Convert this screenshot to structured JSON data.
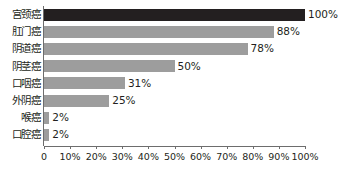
{
  "chart_data": {
    "type": "bar",
    "orientation": "horizontal",
    "title": "",
    "xlabel": "",
    "ylabel": "",
    "xlim": [
      0,
      100
    ],
    "grid": false,
    "legend": null,
    "categories": [
      "宫颈癌",
      "肛门癌",
      "阴道癌",
      "阴茎癌",
      "口咽癌",
      "外阴癌",
      "喉癌",
      "口腔癌"
    ],
    "values": [
      100,
      88,
      78,
      50,
      31,
      25,
      2,
      2
    ],
    "value_labels": [
      "100%",
      "88%",
      "78%",
      "50%",
      "31%",
      "25%",
      "2%",
      "2%"
    ],
    "bar_colors": [
      "#231f20",
      "#9d9d9d",
      "#9d9d9d",
      "#9d9d9d",
      "#9d9d9d",
      "#9d9d9d",
      "#9d9d9d",
      "#9d9d9d"
    ],
    "xticks": [
      0,
      10,
      20,
      30,
      40,
      50,
      60,
      70,
      80,
      90,
      100
    ],
    "xticklabels": [
      "0",
      "10%",
      "20%",
      "30%",
      "40%",
      "50%",
      "60%",
      "70%",
      "80%",
      "90%",
      "100%"
    ]
  },
  "colors": {
    "highlight_bar": "#231f20",
    "normal_bar": "#9d9d9d",
    "axis": "#6d6d6d",
    "text": "#231f20",
    "background": "#ffffff"
  }
}
